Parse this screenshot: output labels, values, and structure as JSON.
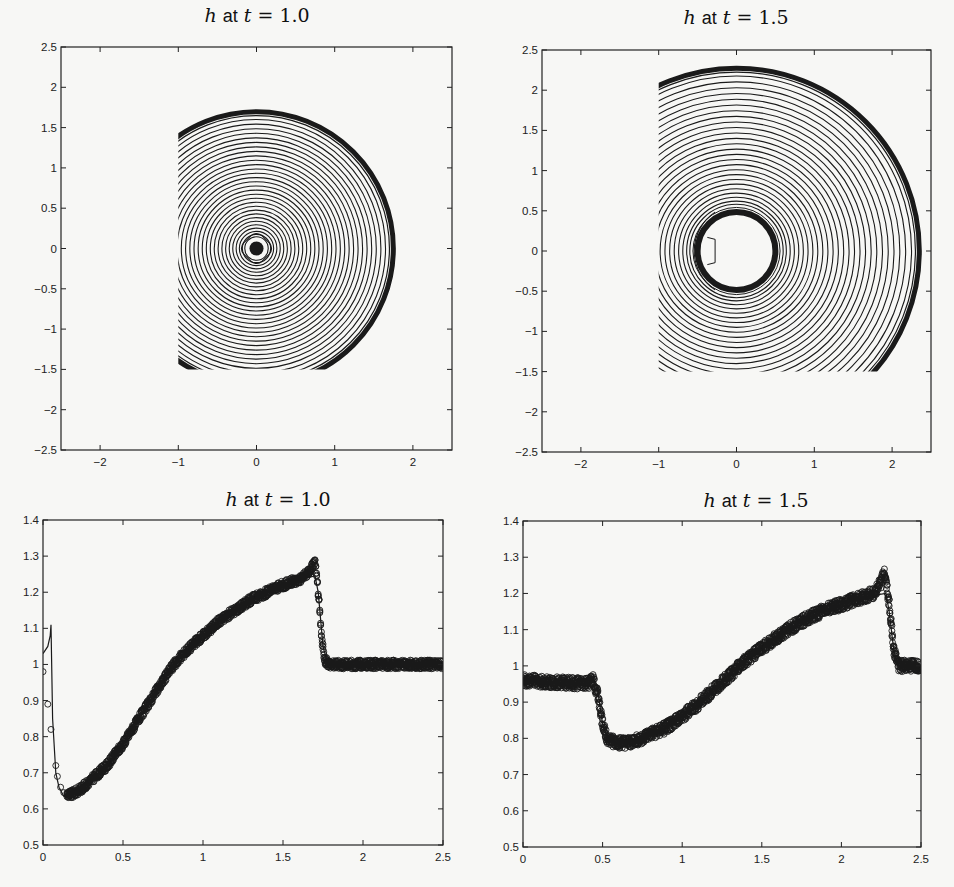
{
  "figure": {
    "background": "#f7f7f5",
    "ink": "#1a1a1a"
  },
  "chart_data": [
    {
      "id": "contour-t1",
      "type": "contour",
      "title": "h at t = 1.0",
      "title_parts": {
        "var": "h",
        "word": "at",
        "t": "t",
        "eq": "=",
        "value": "1.0"
      },
      "xlabel": "",
      "ylabel": "",
      "xlim": [
        -2.5,
        2.5
      ],
      "ylim": [
        -2.5,
        2.5
      ],
      "xticks": [
        -2,
        -1,
        0,
        1,
        2
      ],
      "xtick_labels": [
        "−2",
        "−1",
        "0",
        "1",
        "2"
      ],
      "yticks": [
        2.5,
        2,
        1.5,
        1,
        0.5,
        0,
        -0.5,
        -1,
        -1.5,
        -2,
        -2.5
      ],
      "ytick_labels": [
        "2.5",
        "2",
        "1.5",
        "1",
        "0.5",
        "0",
        "−0.5",
        "−1",
        "−1.5",
        "−2",
        "−2.5"
      ],
      "domain": {
        "x": [
          -1,
          2.5
        ],
        "y": [
          -1.5,
          2.5
        ]
      },
      "center": [
        0,
        0
      ],
      "shock_radius": 1.75,
      "inner_dot_radius": 0.09,
      "contour_radius_range": [
        0.15,
        1.65
      ],
      "contour_count": 30,
      "grid": false
    },
    {
      "id": "contour-t15",
      "type": "contour",
      "title": "h at t = 1.5",
      "title_parts": {
        "var": "h",
        "word": "at",
        "t": "t",
        "eq": "=",
        "value": "1.5"
      },
      "xlabel": "",
      "ylabel": "",
      "xlim": [
        -2.5,
        2.5
      ],
      "ylim": [
        -2.5,
        2.5
      ],
      "xticks": [
        -2,
        -1,
        0,
        1,
        2
      ],
      "xtick_labels": [
        "−2",
        "−1",
        "0",
        "1",
        "2"
      ],
      "yticks": [
        2.5,
        2,
        1.5,
        1,
        0.5,
        0,
        -0.5,
        -1,
        -1.5,
        -2,
        -2.5
      ],
      "ytick_labels": [
        "2.5",
        "2",
        "1.5",
        "1",
        "0.5",
        "0",
        "−0.5",
        "−1",
        "−1.5",
        "−2",
        "−2.5"
      ],
      "domain": {
        "x": [
          -1,
          2.5
        ],
        "y": [
          -1.5,
          2.5
        ]
      },
      "center": [
        0,
        0
      ],
      "shock_radius": 2.35,
      "inner_ring_radius": 0.5,
      "contour_radius_range": [
        0.6,
        2.25
      ],
      "contour_count": 26,
      "grid": false
    },
    {
      "id": "profile-t1",
      "type": "scatter",
      "title": "h at t = 1.0",
      "title_parts": {
        "var": "h",
        "word": "at",
        "t": "t",
        "eq": "=",
        "value": "1.0"
      },
      "xlabel": "",
      "ylabel": "",
      "xlim": [
        0,
        2.5
      ],
      "ylim": [
        0.5,
        1.4
      ],
      "xticks": [
        0,
        0.5,
        1,
        1.5,
        2,
        2.5
      ],
      "xtick_labels": [
        "0",
        "0.5",
        "1",
        "1.5",
        "2",
        "2.5"
      ],
      "yticks": [
        0.5,
        0.6,
        0.7,
        0.8,
        0.9,
        1,
        1.1,
        1.2,
        1.3,
        1.4
      ],
      "ytick_labels": [
        "0.5",
        "0.6",
        "0.7",
        "0.8",
        "0.9",
        "1",
        "1.1",
        "1.2",
        "1.3",
        "1.4"
      ],
      "grid": false,
      "series": [
        {
          "name": "reference (solid line)",
          "style": "line",
          "x": [
            0.0,
            0.03,
            0.045,
            0.05,
            0.06,
            0.08,
            0.1,
            0.13,
            0.16,
            0.2,
            0.25,
            0.3,
            0.4,
            0.5,
            0.6,
            0.7,
            0.8,
            0.9,
            1.0,
            1.1,
            1.2,
            1.3,
            1.4,
            1.5,
            1.6,
            1.7,
            1.72,
            1.75,
            1.78,
            1.8,
            2.0,
            2.2,
            2.5
          ],
          "y": [
            1.03,
            1.05,
            1.08,
            1.11,
            0.85,
            0.7,
            0.66,
            0.635,
            0.63,
            0.635,
            0.65,
            0.67,
            0.72,
            0.78,
            0.85,
            0.92,
            0.99,
            1.04,
            1.08,
            1.12,
            1.15,
            1.18,
            1.2,
            1.22,
            1.235,
            1.245,
            1.2,
            1.05,
            1.0,
            1.0,
            1.0,
            1.0,
            1.0
          ]
        },
        {
          "name": "numerical (circles)",
          "style": "markers",
          "x": [
            0.0,
            0.03,
            0.05,
            0.08,
            0.09,
            0.11,
            0.13,
            0.15,
            0.18,
            0.2,
            0.25,
            0.3,
            0.4,
            0.5,
            0.6,
            0.7,
            0.8,
            0.9,
            1.0,
            1.1,
            1.2,
            1.3,
            1.4,
            1.5,
            1.6,
            1.65,
            1.68,
            1.7,
            1.72,
            1.74,
            1.76,
            1.8,
            2.0,
            2.2,
            2.5
          ],
          "y": [
            0.98,
            0.89,
            0.82,
            0.72,
            0.69,
            0.66,
            0.645,
            0.64,
            0.64,
            0.645,
            0.66,
            0.68,
            0.72,
            0.78,
            0.85,
            0.92,
            0.99,
            1.04,
            1.08,
            1.12,
            1.15,
            1.18,
            1.2,
            1.22,
            1.235,
            1.25,
            1.27,
            1.285,
            1.2,
            1.08,
            1.01,
            1.0,
            1.0,
            1.0,
            1.0
          ],
          "band_halfwidth": 0.012
        }
      ]
    },
    {
      "id": "profile-t15",
      "type": "scatter",
      "title": "h at t = 1.5",
      "title_parts": {
        "var": "h",
        "word": "at",
        "t": "t",
        "eq": "=",
        "value": "1.5"
      },
      "xlabel": "",
      "ylabel": "",
      "xlim": [
        0,
        2.5
      ],
      "ylim": [
        0.5,
        1.4
      ],
      "xticks": [
        0,
        0.5,
        1,
        1.5,
        2,
        2.5
      ],
      "xtick_labels": [
        "0",
        "0.5",
        "1",
        "1.5",
        "2",
        "2.5"
      ],
      "yticks": [
        0.5,
        0.6,
        0.7,
        0.8,
        0.9,
        1,
        1.1,
        1.2,
        1.3,
        1.4
      ],
      "ytick_labels": [
        "0.5",
        "0.6",
        "0.7",
        "0.8",
        "0.9",
        "1",
        "1.1",
        "1.2",
        "1.3",
        "1.4"
      ],
      "grid": false,
      "series": [
        {
          "name": "reference (solid line)",
          "style": "line",
          "x": [
            0.0,
            0.2,
            0.4,
            0.44,
            0.47,
            0.5,
            0.53,
            0.57,
            0.65,
            0.75,
            0.9,
            1.0,
            1.1,
            1.2,
            1.3,
            1.4,
            1.5,
            1.6,
            1.7,
            1.8,
            1.9,
            2.0,
            2.1,
            2.2,
            2.28,
            2.3,
            2.33,
            2.36,
            2.5
          ],
          "y": [
            0.96,
            0.955,
            0.95,
            0.965,
            0.93,
            0.84,
            0.8,
            0.79,
            0.785,
            0.8,
            0.83,
            0.86,
            0.895,
            0.935,
            0.975,
            1.015,
            1.05,
            1.08,
            1.11,
            1.135,
            1.155,
            1.17,
            1.185,
            1.195,
            1.2,
            1.15,
            1.04,
            1.0,
            1.0
          ]
        },
        {
          "name": "numerical (circles)",
          "style": "markers",
          "x": [
            0.0,
            0.2,
            0.4,
            0.44,
            0.47,
            0.5,
            0.53,
            0.57,
            0.65,
            0.75,
            0.9,
            1.0,
            1.1,
            1.2,
            1.3,
            1.4,
            1.5,
            1.6,
            1.7,
            1.8,
            1.9,
            2.0,
            2.1,
            2.2,
            2.25,
            2.27,
            2.3,
            2.33,
            2.36,
            2.5
          ],
          "y": [
            0.96,
            0.955,
            0.95,
            0.96,
            0.92,
            0.84,
            0.8,
            0.79,
            0.785,
            0.8,
            0.83,
            0.86,
            0.895,
            0.935,
            0.975,
            1.015,
            1.05,
            1.08,
            1.11,
            1.135,
            1.155,
            1.17,
            1.185,
            1.2,
            1.23,
            1.26,
            1.17,
            1.04,
            1.0,
            1.0
          ],
          "band_halfwidth": 0.016
        }
      ]
    }
  ],
  "layout": {
    "panels": [
      {
        "chart": 0,
        "box": {
          "left": 61,
          "top": 47,
          "right": 452,
          "bottom": 450
        },
        "title_x": 257,
        "title_y": 4
      },
      {
        "chart": 1,
        "box": {
          "left": 542,
          "top": 50,
          "right": 931,
          "bottom": 452
        },
        "title_x": 736,
        "title_y": 6
      },
      {
        "chart": 2,
        "box": {
          "left": 43,
          "top": 520,
          "right": 443,
          "bottom": 845
        },
        "title_x": 278,
        "title_y": 488
      },
      {
        "chart": 3,
        "box": {
          "left": 523,
          "top": 521,
          "right": 921,
          "bottom": 847
        },
        "title_x": 756,
        "title_y": 489
      }
    ]
  }
}
